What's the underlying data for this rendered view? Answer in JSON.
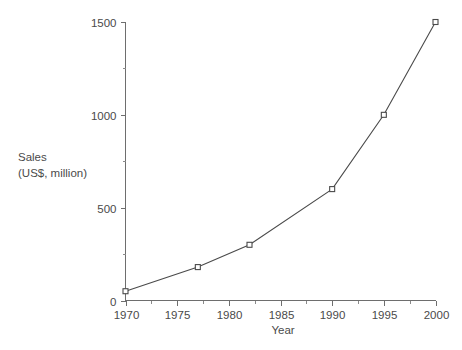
{
  "chart_data": {
    "type": "line",
    "title": "",
    "xlabel": "Year",
    "ylabel_line1": "Sales",
    "ylabel_line2": "(US$, million)",
    "ylabel_full": "Sales (US$, million)",
    "x": [
      1970,
      1977,
      1982,
      1990,
      1995,
      2000
    ],
    "values": [
      50,
      180,
      300,
      600,
      1000,
      1500
    ],
    "series": [
      {
        "name": "Sales",
        "points": [
          {
            "x": 1970,
            "y": 50
          },
          {
            "x": 1977,
            "y": 180
          },
          {
            "x": 1982,
            "y": 300
          },
          {
            "x": 1990,
            "y": 600
          },
          {
            "x": 1995,
            "y": 1000
          },
          {
            "x": 2000,
            "y": 1500
          }
        ]
      }
    ],
    "xlim": [
      1970,
      2000
    ],
    "ylim": [
      0,
      1500
    ],
    "xticks": [
      1970,
      1975,
      1980,
      1985,
      1990,
      1995,
      2000
    ],
    "xtick_labels": [
      "1970",
      "1975",
      "1980",
      "1985",
      "1990",
      "1995",
      "2000"
    ],
    "xticks_minor": [
      1972.5,
      1977.5,
      1982.5,
      1987.5,
      1992.5,
      1997.5
    ],
    "yticks": [
      0,
      500,
      1000,
      1500
    ],
    "ytick_labels": [
      "0",
      "500",
      "1000",
      "1500"
    ],
    "yticks_minor": [
      250,
      750,
      1250
    ],
    "grid": false,
    "legend": false,
    "marker": "open-square",
    "colors": {
      "line": "#4a4a4a",
      "marker_fill": "#ffffff",
      "marker_stroke": "#4a4a4a",
      "axis": "#6e6e6e",
      "text": "#4a4a4a",
      "background": "#ffffff"
    }
  }
}
